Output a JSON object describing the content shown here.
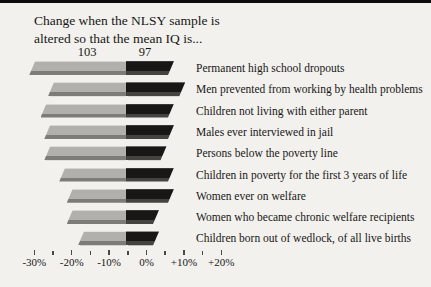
{
  "chart_data": {
    "type": "bar",
    "orientation": "horizontal-diverging",
    "title_lines": [
      "Change when the NLSY sample is",
      "altered so that the mean IQ is..."
    ],
    "categories": [
      "Permanent high school dropouts",
      "Men prevented from working by health problems",
      "Children not living with either parent",
      "Males ever interviewed in jail",
      "Persons below the poverty line",
      "Children in poverty for the first 3 years of life",
      "Women ever on welfare",
      "Women who became chronic welfare recipients",
      "Children born out of wedlock, of all live births"
    ],
    "series": [
      {
        "name": "103",
        "color": "#b2b0ac",
        "values": [
          -25,
          -20,
          -22,
          -21,
          -21,
          -17,
          -15,
          -15,
          -12
        ]
      },
      {
        "name": "97",
        "color": "#181715",
        "values": [
          12,
          15,
          12,
          12,
          10,
          12,
          12,
          8,
          8
        ]
      }
    ],
    "x_axis": {
      "unit": "%",
      "xlim": [
        -30,
        20
      ],
      "minor_step": 5,
      "major_step": 10,
      "tick_labels": [
        "-30%",
        "-20%",
        "-10%",
        "0%",
        "+10%",
        "+20%"
      ]
    },
    "grid": false,
    "legend_position": "column headers above bars",
    "accent_colors": {
      "background": "#f2f1ee",
      "top_rule": "#0d0d0d",
      "text": "#181715"
    }
  }
}
